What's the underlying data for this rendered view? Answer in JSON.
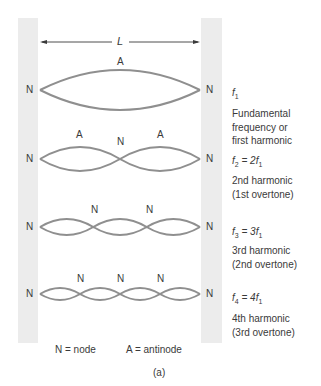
{
  "figure": {
    "length_label": "L",
    "caption": "(a)",
    "colors": {
      "wall": "#ececec",
      "string": "#8f8f8f",
      "text": "#3a3a3a"
    },
    "legend": {
      "node": "N = node",
      "antinode": "A = antinode"
    },
    "modes": [
      {
        "harmonic": 1,
        "loops": 1,
        "end_labels": [
          "N",
          "N"
        ],
        "top_labels": [
          "A"
        ],
        "freq": {
          "sym": "f",
          "sub": "1",
          "rest": ""
        },
        "description": [
          "Fundamental",
          "frequency or",
          "first harmonic"
        ]
      },
      {
        "harmonic": 2,
        "loops": 2,
        "end_labels": [
          "N",
          "N"
        ],
        "top_labels": [
          "A",
          "N",
          "A"
        ],
        "freq": {
          "sym": "f",
          "sub": "2",
          "rest": " = 2f",
          "rest_sub": "1"
        },
        "description": [
          "2nd harmonic",
          "(1st overtone)"
        ]
      },
      {
        "harmonic": 3,
        "loops": 3,
        "end_labels": [
          "N",
          "N"
        ],
        "top_labels": [
          "N",
          "N"
        ],
        "freq": {
          "sym": "f",
          "sub": "3",
          "rest": " = 3f",
          "rest_sub": "1"
        },
        "description": [
          "3rd harmonic",
          "(2nd overtone)"
        ]
      },
      {
        "harmonic": 4,
        "loops": 4,
        "end_labels": [
          "N",
          "N"
        ],
        "top_labels": [
          "N",
          "N",
          "N"
        ],
        "freq": {
          "sym": "f",
          "sub": "4",
          "rest": " = 4f",
          "rest_sub": "1"
        },
        "description": [
          "4th harmonic",
          "(3rd overtone)"
        ]
      }
    ]
  }
}
